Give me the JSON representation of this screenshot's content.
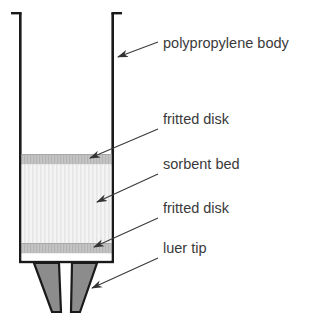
{
  "diagram": {
    "background_color": "#ffffff",
    "outline_color": "#1a1a1a",
    "labels": [
      {
        "id": "polypropylene-body",
        "text": "polypropylene body",
        "text_x": 163,
        "text_y": 48,
        "leader_from_x": 158,
        "leader_from_y": 42,
        "leader_to_x": 114,
        "leader_to_y": 58
      },
      {
        "id": "fritted-disk-top",
        "text": "fritted disk",
        "text_x": 163,
        "text_y": 124,
        "leader_from_x": 158,
        "leader_from_y": 129,
        "leader_to_x": 86,
        "leader_to_y": 159
      },
      {
        "id": "sorbent-bed",
        "text": "sorbent bed",
        "text_x": 163,
        "text_y": 169,
        "leader_from_x": 158,
        "leader_from_y": 174,
        "leader_to_x": 93,
        "leader_to_y": 203
      },
      {
        "id": "fritted-disk-bottom",
        "text": "fritted disk",
        "text_x": 163,
        "text_y": 213,
        "leader_from_x": 158,
        "leader_from_y": 218,
        "leader_to_x": 90,
        "leader_to_y": 248
      },
      {
        "id": "luer-tip",
        "text": "luer tip",
        "text_x": 163,
        "text_y": 253,
        "leader_from_x": 158,
        "leader_from_y": 258,
        "leader_to_x": 88,
        "leader_to_y": 289
      }
    ],
    "parts": {
      "body": {
        "name": "polypropylene body",
        "fill": "#ffffff",
        "stroke": "#1a1a1a",
        "left_wall_x": 20,
        "right_wall_x": 113,
        "top_y": 12,
        "bottom_y": 263,
        "wall_thickness": 2.5
      },
      "fritted_disk_top": {
        "name": "fritted disk",
        "fill": "#bdbdbd",
        "top_y": 154,
        "bottom_y": 164
      },
      "sorbent_bed": {
        "name": "sorbent bed",
        "fill": "#f2f2f2",
        "stripe_color": "#e2e2e2",
        "top_y": 164,
        "bottom_y": 243
      },
      "fritted_disk_bottom": {
        "name": "fritted disk",
        "fill": "#c9c9c9",
        "top_y": 243,
        "bottom_y": 253
      },
      "luer_tip": {
        "name": "luer tip",
        "fill": "#8a8a8a",
        "stroke": "#1a1a1a",
        "top_y": 263,
        "bottom_y": 318
      }
    }
  }
}
